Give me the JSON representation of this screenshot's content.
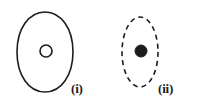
{
  "figure": {
    "type": "line-diagram",
    "background_color": "#ffffff",
    "stroke_color": "#1c1c1c",
    "width": 200,
    "height": 108,
    "panels": [
      {
        "id": "panel-i",
        "label": "(i)",
        "outline": {
          "name": "oval-outline-solid",
          "shape": "oval",
          "stroke_style": "solid",
          "fill": "#ffffff",
          "stroke_color": "#1c1c1c",
          "stroke_width": 1.6,
          "center_x": 45,
          "center_y": 52,
          "radius_x": 28,
          "radius_y": 40
        },
        "inner": {
          "name": "inner-circle-hollow",
          "shape": "circle",
          "fill": "#ffffff",
          "stroke_style": "solid",
          "stroke_color": "#1c1c1c",
          "stroke_width": 1.6,
          "center_x": 46,
          "center_y": 51,
          "radius": 6
        },
        "label_x": 71,
        "label_y": 82
      },
      {
        "id": "panel-ii",
        "label": "(ii)",
        "outline": {
          "name": "ellipse-outline-dashed",
          "shape": "ellipse",
          "stroke_style": "dashed",
          "dash_pattern": "5 4",
          "fill": "#ffffff",
          "stroke_color": "#1c1c1c",
          "stroke_width": 1.6,
          "center_x": 140,
          "center_y": 52,
          "radius_x": 18,
          "radius_y": 35
        },
        "inner": {
          "name": "inner-dot-filled",
          "shape": "circle",
          "fill": "#1c1c1c",
          "stroke_style": "solid",
          "stroke_color": "#1c1c1c",
          "stroke_width": 1,
          "center_x": 141,
          "center_y": 51,
          "radius": 6
        },
        "label_x": 158,
        "label_y": 82
      }
    ]
  }
}
